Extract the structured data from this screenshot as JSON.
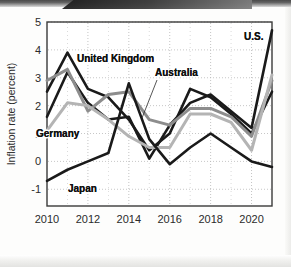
{
  "chart_data": {
    "type": "line",
    "title": "",
    "xlabel": "",
    "ylabel": "Inflation rate (percent)",
    "xlim": [
      2010,
      2021
    ],
    "ylim": [
      -1.6,
      5
    ],
    "xticks": [
      "2010",
      "2012",
      "2014",
      "2016",
      "2018",
      "2020"
    ],
    "xtick_values": [
      2010,
      2012,
      2014,
      2016,
      2018,
      2020
    ],
    "yticks": [
      "5",
      "4",
      "3",
      "2",
      "1",
      "0",
      "-1"
    ],
    "ytick_values": [
      5,
      4,
      3,
      2,
      1,
      0,
      -1
    ],
    "grid": true,
    "legend_position": "inline-annotations",
    "x": [
      2010,
      2011,
      2012,
      2013,
      2014,
      2015,
      2016,
      2017,
      2018,
      2019,
      2020,
      2021
    ],
    "series": [
      {
        "name": "United Kingdom",
        "color": "#1a1a1a",
        "width": 2.6,
        "values": [
          2.5,
          3.9,
          2.6,
          2.3,
          1.5,
          0.4,
          1.0,
          2.6,
          2.3,
          1.7,
          1.0,
          2.5
        ]
      },
      {
        "name": "U.S.",
        "color": "#1a1a1a",
        "width": 2.6,
        "values": [
          1.6,
          3.2,
          2.1,
          1.5,
          1.6,
          0.1,
          1.3,
          2.1,
          2.4,
          1.8,
          1.2,
          4.7
        ]
      },
      {
        "name": "Australia",
        "color": "#8d8d8d",
        "width": 3.0,
        "values": [
          2.9,
          3.3,
          1.8,
          2.4,
          2.5,
          1.5,
          1.3,
          1.9,
          1.9,
          1.6,
          0.9,
          2.9
        ]
      },
      {
        "name": "Germany",
        "color": "#b4b4b4",
        "width": 3.0,
        "values": [
          1.1,
          2.1,
          2.0,
          1.5,
          0.9,
          0.5,
          0.5,
          1.7,
          1.7,
          1.4,
          0.4,
          3.1
        ]
      },
      {
        "name": "Japan",
        "color": "#1a1a1a",
        "width": 2.6,
        "values": [
          -0.7,
          -0.3,
          0.0,
          0.3,
          2.8,
          0.8,
          -0.1,
          0.5,
          1.0,
          0.5,
          0.0,
          -0.2
        ]
      }
    ],
    "annotations": [
      {
        "text": "United Kingdom",
        "x_px": 77,
        "y_px": 62,
        "leader": false
      },
      {
        "text": "Australia",
        "x_px": 155,
        "y_px": 76,
        "leader": true,
        "leader_x1": 157,
        "leader_y1": 80,
        "leader_x2": 142,
        "leader_y2": 118
      },
      {
        "text": "Germany",
        "x_px": 36,
        "y_px": 137,
        "leader": false
      },
      {
        "text": "Japan",
        "x_px": 68,
        "y_px": 192,
        "leader": false
      },
      {
        "text": "U.S.",
        "x_px": 244,
        "y_px": 40,
        "leader": false
      }
    ],
    "colors": {
      "axis": "#3a3a3a",
      "grid": "#b9b9b9",
      "plot_background": "#ffffff",
      "text": "#2b2b2b"
    }
  }
}
